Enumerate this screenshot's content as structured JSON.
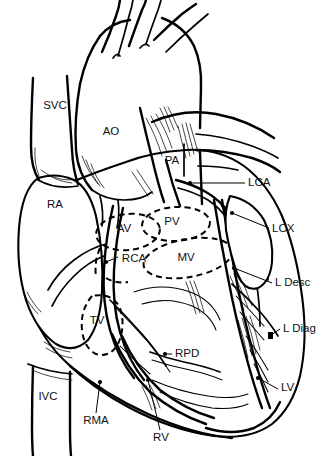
{
  "figure": {
    "kind": "anatomical-line-drawing",
    "background_color": "#ffffff",
    "ink_color": "#000000",
    "width": 326,
    "height": 456
  },
  "labels": {
    "svc": "SVC",
    "ao": "AO",
    "ra": "RA",
    "pa": "PA",
    "lca": "LCA",
    "lcx": "LCX",
    "av": "AV",
    "pv": "PV",
    "rca": "RCA",
    "mv": "MV",
    "l_desc": "L Desc",
    "l_diag": "L Diag",
    "tv": "TV",
    "rpd": "RPD",
    "lv": "LV",
    "ivc": "IVC",
    "rma": "RMA",
    "rv": "RV"
  },
  "label_list": [
    {
      "id": "svc",
      "text": "SVC",
      "x": 55,
      "y": 106,
      "anchor": "middle",
      "leader": false
    },
    {
      "id": "ao",
      "text": "AO",
      "x": 111,
      "y": 132,
      "anchor": "middle",
      "leader": false
    },
    {
      "id": "ra",
      "text": "RA",
      "x": 55,
      "y": 205,
      "anchor": "middle",
      "leader": false
    },
    {
      "id": "pa",
      "text": "PA",
      "x": 172,
      "y": 161,
      "anchor": "middle",
      "leader": false
    },
    {
      "id": "lca",
      "text": "LCA",
      "x": 248,
      "y": 183,
      "anchor": "start",
      "leader": true
    },
    {
      "id": "lcx",
      "text": "LCX",
      "x": 272,
      "y": 229,
      "anchor": "start",
      "leader": true
    },
    {
      "id": "av",
      "text": "AV",
      "x": 124,
      "y": 229,
      "anchor": "middle",
      "leader": false
    },
    {
      "id": "pv",
      "text": "PV",
      "x": 172,
      "y": 222,
      "anchor": "middle",
      "leader": false
    },
    {
      "id": "rca",
      "text": "RCA",
      "x": 132,
      "y": 259,
      "anchor": "middle",
      "leader": true
    },
    {
      "id": "mv",
      "text": "MV",
      "x": 186,
      "y": 258,
      "anchor": "middle",
      "leader": false
    },
    {
      "id": "l_desc",
      "text": "L Desc",
      "x": 275,
      "y": 283,
      "anchor": "start",
      "leader": true
    },
    {
      "id": "l_diag",
      "text": "L Diag",
      "x": 283,
      "y": 329,
      "anchor": "start",
      "leader": true
    },
    {
      "id": "tv",
      "text": "TV",
      "x": 97,
      "y": 321,
      "anchor": "middle",
      "leader": false
    },
    {
      "id": "rpd",
      "text": "RPD",
      "x": 175,
      "y": 354,
      "anchor": "start",
      "leader": true
    },
    {
      "id": "lv",
      "text": "LV",
      "x": 281,
      "y": 388,
      "anchor": "start",
      "leader": true
    },
    {
      "id": "ivc",
      "text": "IVC",
      "x": 48,
      "y": 397,
      "anchor": "middle",
      "leader": false
    },
    {
      "id": "rma",
      "text": "RMA",
      "x": 96,
      "y": 421,
      "anchor": "middle",
      "leader": true
    },
    {
      "id": "rv",
      "text": "RV",
      "x": 161,
      "y": 438,
      "anchor": "middle",
      "leader": true
    }
  ],
  "structures": {
    "chambers": [
      "RA",
      "RV",
      "LV"
    ],
    "great_vessels": [
      "SVC",
      "IVC",
      "AO",
      "PA"
    ],
    "valves": [
      "AV",
      "PV",
      "MV",
      "TV"
    ],
    "coronary_arteries": [
      "LCA",
      "LCX",
      "L Desc",
      "L Diag",
      "RCA",
      "RMA",
      "RPD"
    ]
  }
}
